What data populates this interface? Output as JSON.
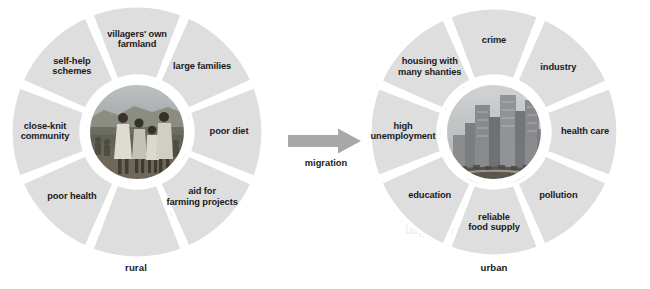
{
  "figure": {
    "type": "two-wheel comparison diagram",
    "colors": {
      "segment_fill": "#dedede",
      "gap": "#ffffff",
      "text": "#1b1b1b",
      "arrow": "#a8a8a8",
      "background": "#ffffff"
    }
  },
  "left_wheel": {
    "caption": "rural",
    "hub_image_alt": "villagers standing on rural hillside",
    "segments": [
      {
        "label": "villagers' own farmland",
        "lines": [
          "villagers' own",
          "farmland"
        ]
      },
      {
        "label": "large families",
        "lines": [
          "large families"
        ]
      },
      {
        "label": "poor diet",
        "lines": [
          "poor diet"
        ]
      },
      {
        "label": "aid for farming projects",
        "lines": [
          "aid for",
          "farming projects"
        ]
      },
      {
        "label": "",
        "lines": []
      },
      {
        "label": "poor health",
        "lines": [
          "poor health"
        ]
      },
      {
        "label": "close-knit community",
        "lines": [
          "close-knit",
          "community"
        ]
      },
      {
        "label": "self-help schemes",
        "lines": [
          "self-help",
          "schemes"
        ]
      }
    ]
  },
  "connector": {
    "label": "migration",
    "icon": "arrow-right-icon",
    "direction": "left-to-right"
  },
  "right_wheel": {
    "caption": "urban",
    "hub_image_alt": "city skyline with tall office towers",
    "segments": [
      {
        "label": "crime",
        "lines": [
          "crime"
        ]
      },
      {
        "label": "industry",
        "lines": [
          "industry"
        ]
      },
      {
        "label": "health care",
        "lines": [
          "health care"
        ]
      },
      {
        "label": "pollution",
        "lines": [
          "pollution"
        ]
      },
      {
        "label": "reliable food supply",
        "lines": [
          "reliable",
          "food supply"
        ]
      },
      {
        "label": "education",
        "lines": [
          "education"
        ]
      },
      {
        "label": "high unemployment",
        "lines": [
          "high",
          "unemployment"
        ]
      },
      {
        "label": "housing with many shanties",
        "lines": [
          "housing with",
          "many shanties"
        ]
      }
    ]
  },
  "bleed_through_text": [
    "uncommon",
    "common",
    "The data",
    "it shows"
  ]
}
